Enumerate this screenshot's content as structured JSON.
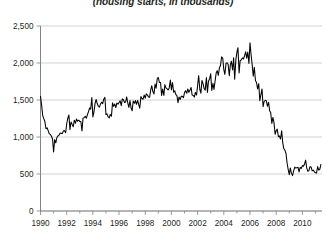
{
  "subtitle": "(housing starts, in thousands)",
  "chart_data": {
    "type": "line",
    "title": "",
    "subtitle": "(housing starts, in thousands)",
    "xlabel": "",
    "ylabel": "",
    "xlim": [
      1990.0,
      2011.5
    ],
    "ylim": [
      0,
      2500
    ],
    "grid": true,
    "legend": false,
    "y_ticks": [
      0,
      500,
      1000,
      1500,
      2000,
      2500
    ],
    "y_tick_labels": [
      "0",
      "500",
      "1,000",
      "1,500",
      "2,000",
      "2,500"
    ],
    "x_ticks": [
      1990,
      1992,
      1994,
      1996,
      1998,
      2000,
      2002,
      2004,
      2006,
      2008,
      2010
    ],
    "x_tick_labels": [
      "1990",
      "1992",
      "1994",
      "1996",
      "1998",
      "2000",
      "2002",
      "2004",
      "2006",
      "2008",
      "2010"
    ],
    "x_minor_ticks": [
      1991,
      1993,
      1995,
      1997,
      1999,
      2001,
      2003,
      2005,
      2007,
      2009,
      2011
    ],
    "series": [
      {
        "name": "Housing starts",
        "color": "#000000",
        "x": [
          1990.0,
          1990.08,
          1990.17,
          1990.25,
          1990.33,
          1990.42,
          1990.5,
          1990.58,
          1990.67,
          1990.75,
          1990.83,
          1990.92,
          1991.0,
          1991.08,
          1991.17,
          1991.25,
          1991.33,
          1991.42,
          1991.5,
          1991.58,
          1991.67,
          1991.75,
          1991.83,
          1991.92,
          1992.0,
          1992.08,
          1992.17,
          1992.25,
          1992.33,
          1992.42,
          1992.5,
          1992.58,
          1992.67,
          1992.75,
          1992.83,
          1992.92,
          1993.0,
          1993.08,
          1993.17,
          1993.25,
          1993.33,
          1993.42,
          1993.5,
          1993.58,
          1993.67,
          1993.75,
          1993.83,
          1993.92,
          1994.0,
          1994.08,
          1994.17,
          1994.25,
          1994.33,
          1994.42,
          1994.5,
          1994.58,
          1994.67,
          1994.75,
          1994.83,
          1994.92,
          1995.0,
          1995.08,
          1995.17,
          1995.25,
          1995.33,
          1995.42,
          1995.5,
          1995.58,
          1995.67,
          1995.75,
          1995.83,
          1995.92,
          1996.0,
          1996.08,
          1996.17,
          1996.25,
          1996.33,
          1996.42,
          1996.5,
          1996.58,
          1996.67,
          1996.75,
          1996.83,
          1996.92,
          1997.0,
          1997.08,
          1997.17,
          1997.25,
          1997.33,
          1997.42,
          1997.5,
          1997.58,
          1997.67,
          1997.75,
          1997.83,
          1997.92,
          1998.0,
          1998.08,
          1998.17,
          1998.25,
          1998.33,
          1998.42,
          1998.5,
          1998.58,
          1998.67,
          1998.75,
          1998.83,
          1998.92,
          1999.0,
          1999.08,
          1999.17,
          1999.25,
          1999.33,
          1999.42,
          1999.5,
          1999.58,
          1999.67,
          1999.75,
          1999.83,
          1999.92,
          2000.0,
          2000.08,
          2000.17,
          2000.25,
          2000.33,
          2000.42,
          2000.5,
          2000.58,
          2000.67,
          2000.75,
          2000.83,
          2000.92,
          2001.0,
          2001.08,
          2001.17,
          2001.25,
          2001.33,
          2001.42,
          2001.5,
          2001.58,
          2001.67,
          2001.75,
          2001.83,
          2001.92,
          2002.0,
          2002.08,
          2002.17,
          2002.25,
          2002.33,
          2002.42,
          2002.5,
          2002.58,
          2002.67,
          2002.75,
          2002.83,
          2002.92,
          2003.0,
          2003.08,
          2003.17,
          2003.25,
          2003.33,
          2003.42,
          2003.5,
          2003.58,
          2003.67,
          2003.75,
          2003.83,
          2003.92,
          2004.0,
          2004.08,
          2004.17,
          2004.25,
          2004.33,
          2004.42,
          2004.5,
          2004.58,
          2004.67,
          2004.75,
          2004.83,
          2004.92,
          2005.0,
          2005.08,
          2005.17,
          2005.25,
          2005.33,
          2005.42,
          2005.5,
          2005.58,
          2005.67,
          2005.75,
          2005.83,
          2005.92,
          2006.0,
          2006.08,
          2006.17,
          2006.25,
          2006.33,
          2006.42,
          2006.5,
          2006.58,
          2006.67,
          2006.75,
          2006.83,
          2006.92,
          2007.0,
          2007.08,
          2007.17,
          2007.25,
          2007.33,
          2007.42,
          2007.5,
          2007.58,
          2007.67,
          2007.75,
          2007.83,
          2007.92,
          2008.0,
          2008.08,
          2008.17,
          2008.25,
          2008.33,
          2008.42,
          2008.5,
          2008.58,
          2008.67,
          2008.75,
          2008.83,
          2008.92,
          2009.0,
          2009.08,
          2009.17,
          2009.25,
          2009.33,
          2009.42,
          2009.5,
          2009.58,
          2009.67,
          2009.75,
          2009.83,
          2009.92,
          2010.0,
          2010.08,
          2010.17,
          2010.25,
          2010.33,
          2010.42,
          2010.5,
          2010.58,
          2010.67,
          2010.75,
          2010.83,
          2010.92,
          2011.0,
          2011.08,
          2011.17,
          2011.25,
          2011.33,
          2011.42
        ],
        "values": [
          1551,
          1437,
          1289,
          1248,
          1212,
          1111,
          1125,
          1090,
          1043,
          1035,
          1013,
          970,
          798,
          965,
          921,
          993,
          1013,
          1025,
          1055,
          1049,
          1048,
          1083,
          1086,
          1057,
          1176,
          1250,
          1297,
          1099,
          1203,
          1168,
          1139,
          1226,
          1186,
          1244,
          1214,
          1227,
          1210,
          1210,
          1083,
          1258,
          1260,
          1280,
          1254,
          1300,
          1343,
          1392,
          1376,
          1533,
          1272,
          1337,
          1457,
          1507,
          1452,
          1415,
          1403,
          1445,
          1469,
          1450,
          1511,
          1535,
          1302,
          1313,
          1271,
          1258,
          1304,
          1280,
          1461,
          1414,
          1445,
          1398,
          1458,
          1444,
          1467,
          1489,
          1424,
          1516,
          1504,
          1467,
          1472,
          1541,
          1456,
          1399,
          1492,
          1391,
          1355,
          1486,
          1457,
          1492,
          1442,
          1494,
          1437,
          1390,
          1546,
          1520,
          1510,
          1566,
          1525,
          1584,
          1567,
          1540,
          1536,
          1641,
          1693,
          1614,
          1582,
          1715,
          1660,
          1792,
          1804,
          1738,
          1737,
          1562,
          1649,
          1562,
          1709,
          1663,
          1651,
          1636,
          1663,
          1769,
          1636,
          1737,
          1604,
          1626,
          1575,
          1559,
          1463,
          1541,
          1507,
          1549,
          1551,
          1532,
          1600,
          1625,
          1590,
          1649,
          1605,
          1636,
          1670,
          1567,
          1562,
          1540,
          1602,
          1568,
          1698,
          1829,
          1642,
          1592,
          1764,
          1717,
          1655,
          1633,
          1804,
          1603,
          1753,
          1788,
          1853,
          1629,
          1726,
          1643,
          1751,
          1867,
          1897,
          1833,
          1939,
          1967,
          2083,
          2067,
          1911,
          1846,
          1998,
          2003,
          1981,
          1828,
          1978,
          2024,
          1905,
          2072,
          1782,
          2042,
          2144,
          2207,
          1864,
          2034,
          2041,
          2068,
          2054,
          2095,
          2151,
          2065,
          2149,
          1994,
          2273,
          2119,
          1972,
          1821,
          1942,
          1760,
          1737,
          1650,
          1720,
          1491,
          1570,
          1649,
          1409,
          1480,
          1495,
          1490,
          1415,
          1468,
          1354,
          1330,
          1183,
          1264,
          1197,
          1037,
          1084,
          1107,
          1005,
          1013,
          973,
          1084,
          923,
          844,
          820,
          777,
          652,
          560,
          490,
          582,
          505,
          478,
          540,
          594,
          581,
          586,
          590,
          527,
          588,
          575,
          614,
          604,
          636,
          687,
          583,
          536,
          546,
          599,
          594,
          543,
          553,
          529,
          517,
          512,
          600,
          554,
          561,
          629
        ]
      }
    ]
  },
  "annotations": {
    "peak_label": "",
    "trough_label": ""
  }
}
